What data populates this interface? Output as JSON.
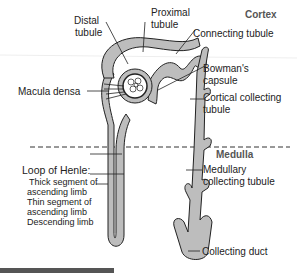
{
  "regions": {
    "cortex": "Cortex",
    "medulla": "Medulla"
  },
  "labels": {
    "distal_line1": "Distal",
    "distal_line2": "tubule",
    "proximal_line1": "Proximal",
    "proximal_line2": "tubule",
    "connecting": "Connecting tubule",
    "bowmans_line1": "Bowman's",
    "bowmans_line2": "capsule",
    "cortical_line1": "Cortical collecting",
    "cortical_line2": "tubule",
    "macula": "Macula densa",
    "loop_title": "Loop of Henle:",
    "thick_line1": "Thick segment of",
    "thick_line2": "ascending limb",
    "thin_line1": "Thin segment of",
    "thin_line2": "ascending limb",
    "descending": "Descending limb",
    "medullary_line1": "Medullary",
    "medullary_line2": "collecting tubule",
    "collecting_duct": "Collecting duct"
  },
  "colors": {
    "tubule_fill": "#bdbdbd",
    "outline": "#222222",
    "bottom_bar": "#555555"
  }
}
